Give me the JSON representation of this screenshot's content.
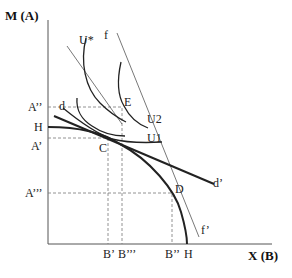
{
  "axes": {
    "y_title": "M (A)",
    "x_title": "X (B)"
  },
  "y_ticks": {
    "a_double_prime": "A’’",
    "h": "H",
    "a_prime": "A’",
    "a_triple_prime": "A’’’"
  },
  "x_ticks": {
    "b_prime": "B’",
    "b_triple_prime": "B’’’",
    "b_double_prime": "B’’",
    "h": "H"
  },
  "points": {
    "c": "C",
    "d": "D",
    "e": "E"
  },
  "curves": {
    "u_star": "U*",
    "u1": "U1",
    "u2": "U2",
    "f": "f",
    "f_prime": "f’",
    "d": "d",
    "d_prime": "d’"
  }
}
